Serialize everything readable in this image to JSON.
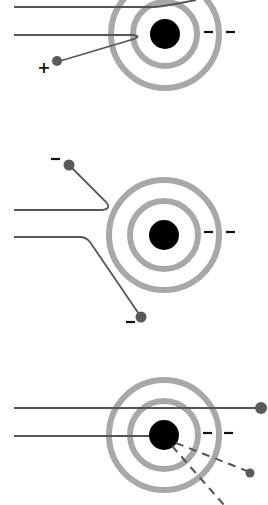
{
  "diagram": {
    "title": "",
    "colors": {
      "background": "#ffffff",
      "nucleus": "#000000",
      "shell": "#a8a8a8",
      "track": "#555555",
      "particle": "#5a5a5a",
      "sign": "#111111"
    },
    "panels": [
      {
        "id": "panel-1",
        "description": "positive particle deflected by atom",
        "nucleus": {
          "cx": 165,
          "cy": 34,
          "r": 15
        },
        "shells": [
          {
            "r": 32
          },
          {
            "r": 54
          }
        ],
        "electron_charges": [
          "−",
          "−"
        ],
        "particle_charge": "+",
        "particle": {
          "cx": 57,
          "cy": 61
        }
      },
      {
        "id": "panel-2",
        "description": "negative particles deflected by atom",
        "nucleus": {
          "cx": 164,
          "cy": 235,
          "r": 15
        },
        "shells": [
          {
            "r": 34
          },
          {
            "r": 55
          }
        ],
        "electron_charges": [
          "−",
          "−"
        ],
        "particle_charges": [
          "−",
          "−"
        ],
        "particles": [
          {
            "cx": 69,
            "cy": 165
          },
          {
            "cx": 141,
            "cy": 317
          }
        ]
      },
      {
        "id": "panel-3",
        "description": "neutral particle passing through, one hitting nucleus",
        "nucleus": {
          "cx": 164,
          "cy": 435,
          "r": 15
        },
        "shells": [
          {
            "r": 34
          },
          {
            "r": 55
          }
        ],
        "electron_charges": [
          "−",
          "−"
        ],
        "particles": [
          {
            "cx": 261,
            "cy": 408
          },
          {
            "cx": 250,
            "cy": 473
          }
        ]
      }
    ]
  }
}
